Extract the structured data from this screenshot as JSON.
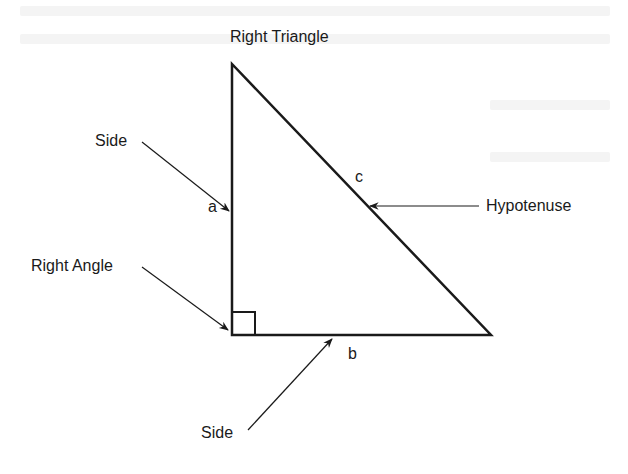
{
  "diagram": {
    "title": "Right Triangle",
    "labels": {
      "side_top": "Side",
      "side_bottom": "Side",
      "right_angle": "Right Angle",
      "hypotenuse": "Hypotenuse",
      "leg_a": "a",
      "leg_b": "b",
      "hyp_c": "c"
    },
    "vertices": {
      "top": [
        232,
        64
      ],
      "right_angle": [
        232,
        335
      ],
      "right": [
        491,
        335
      ]
    },
    "colors": {
      "stroke": "#1a1a1a",
      "background": "#ffffff"
    }
  }
}
